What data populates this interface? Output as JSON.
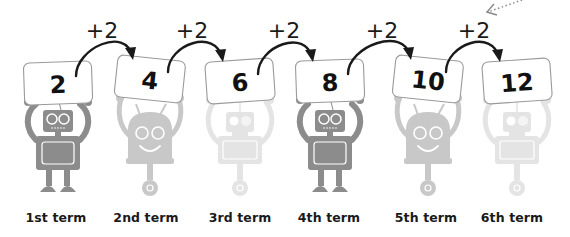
{
  "diagram": {
    "title": "",
    "rule": "+2",
    "terms": [
      {
        "label": "1st term",
        "value": "2",
        "robot": "legged-robot",
        "shade": "#8c8c8c"
      },
      {
        "label": "2nd term",
        "value": "4",
        "robot": "round-wheel-robot",
        "shade": "#c8c8c8"
      },
      {
        "label": "3rd term",
        "value": "6",
        "robot": "square-wheel-robot",
        "shade": "#e4e4e4"
      },
      {
        "label": "4th term",
        "value": "8",
        "robot": "legged-robot",
        "shade": "#8c8c8c"
      },
      {
        "label": "5th term",
        "value": "10",
        "robot": "round-wheel-robot",
        "shade": "#c8c8c8"
      },
      {
        "label": "6th term",
        "value": "12",
        "robot": "square-wheel-robot",
        "shade": "#e4e4e4"
      }
    ],
    "steps": [
      "+2",
      "+2",
      "+2",
      "+2",
      "+2"
    ],
    "pointer": "dotted-arrow-icon"
  },
  "colors": {
    "text": "#111111",
    "card_border": "#9a9a9a",
    "arrow": "#1a1a1a"
  }
}
